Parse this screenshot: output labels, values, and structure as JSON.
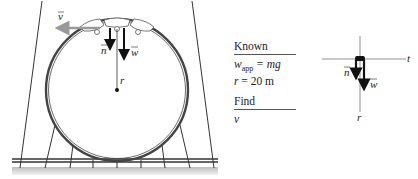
{
  "figure": {
    "type": "roller-coaster vertical loop diagram",
    "loop": {
      "vector_labels": {
        "velocity": "v",
        "normal": "n",
        "weight": "w",
        "radius": "r"
      },
      "colors": {
        "track": "#444444",
        "velocity_arrow": "#999999",
        "force_arrows": "#111111",
        "ground": "#cccccc"
      }
    },
    "known_panel": {
      "known_header": "Known",
      "known_items": [
        {
          "lhs": "w",
          "sub": "app",
          "rhs": "= mg"
        },
        {
          "lhs": "r",
          "sub": "",
          "rhs": "= 20 m"
        }
      ],
      "find_header": "Find",
      "find_items": [
        {
          "lhs": "v"
        }
      ]
    },
    "free_body_diagram": {
      "axis_labels": {
        "tangential": "t",
        "radial": "r"
      },
      "vector_labels": {
        "normal": "n",
        "weight": "w"
      }
    }
  }
}
